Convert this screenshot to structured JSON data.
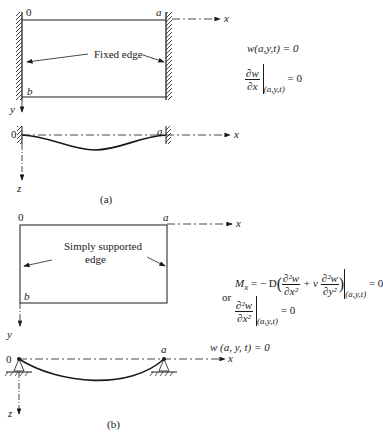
{
  "figure_a": {
    "caption": "(a)",
    "origin_label": "0",
    "a_label": "a",
    "b_label": "b",
    "x_axis_label": "x",
    "y_axis_label": "y",
    "z_axis_label": "z",
    "edge_label": "Fixed edge",
    "side_origin_label": "0",
    "side_a_label": "a",
    "side_x_label": "x",
    "conditions": {
      "deflection": "w(a,y,t) = 0",
      "slope_num": "∂w",
      "slope_den": "∂x",
      "slope_eval": "(a,y,t)",
      "slope_rhs": "= 0"
    }
  },
  "figure_b": {
    "caption": "(b)",
    "origin_label": "0",
    "a_label": "a",
    "b_label": "b",
    "x_axis_label": "x",
    "y_axis_label": "y",
    "z_axis_label": "z",
    "edge_label_line1": "Simply supported",
    "edge_label_line2": "edge",
    "side_origin_label": "0",
    "side_a_label": "a",
    "side_x_label": "x",
    "conditions": {
      "moment_lhs": "M",
      "moment_sub": "x",
      "moment_eq": "= − D",
      "term1_num": "∂²w",
      "term1_den": "∂x²",
      "plus_nu": "+ ν",
      "term2_num": "∂²w",
      "term2_den": "∂y²",
      "moment_eval": "(a,y,t)",
      "moment_rhs": "= 0",
      "or_label": "or",
      "curv_num": "∂²w",
      "curv_den": "∂x²",
      "curv_eval": "(a,y,t)",
      "curv_rhs": "= 0",
      "deflection": "w (a, y, t) = 0"
    }
  },
  "colors": {
    "ink": "#1a1a1a",
    "background": "#ffffff"
  }
}
